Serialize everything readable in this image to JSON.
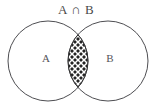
{
  "figure": {
    "type": "venn-diagram",
    "title": "A ∩ B",
    "title_parts": {
      "left_set": "A",
      "operator": "∩",
      "right_set": "B"
    },
    "background_color": "#ffffff",
    "stroke_color": "#4e4e52",
    "label_color": "#55555a",
    "shaded_region_color": "#2a2a2a",
    "hatch_color": "#ffffff",
    "sets": [
      {
        "id": "set-a",
        "label": "A",
        "label_x": 46,
        "label_y": 62,
        "center_x": 48,
        "center_y": 61,
        "radius": 40
      },
      {
        "id": "set-b",
        "label": "B",
        "label_x": 110,
        "label_y": 62,
        "center_x": 108,
        "center_y": 61,
        "radius": 40
      }
    ],
    "intersection": {
      "id": "intersection-region",
      "label": "A ∩ B",
      "fill_style": "cross-hatch",
      "shaded": true,
      "top_x": 78,
      "top_y": 34,
      "bottom_x": 78,
      "bottom_y": 88,
      "max_width": 22
    }
  }
}
